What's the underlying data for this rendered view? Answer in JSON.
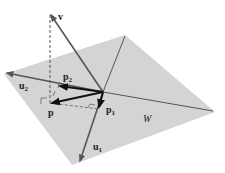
{
  "diagram": {
    "colors": {
      "plane_fill": "#d4d4d4",
      "vector_stroke": "#555555",
      "bold_vector_stroke": "#1a1a1a",
      "axis_line": "#555555",
      "label": "#222222",
      "background": "#ffffff"
    },
    "plane": {
      "label": "W",
      "vertices": [
        [
          125,
          35
        ],
        [
          215,
          112
        ],
        [
          72,
          165
        ],
        [
          4,
          74
        ]
      ]
    },
    "origin": [
      103,
      92
    ],
    "vectors": {
      "v": {
        "label": "v",
        "tip": [
          50,
          13
        ]
      },
      "u1": {
        "label": "u",
        "subscript": "1",
        "tip": [
          80,
          162
        ]
      },
      "u2": {
        "label": "u",
        "subscript": "2",
        "tip": [
          6,
          72
        ]
      },
      "p": {
        "label": "p",
        "tip": [
          50,
          103
        ]
      },
      "p1": {
        "label": "p",
        "subscript": "1",
        "tip": [
          99,
          109
        ]
      },
      "p2": {
        "label": "p",
        "subscript": "2",
        "tip": [
          58,
          87
        ]
      }
    },
    "labels": {
      "v": "v",
      "u1_base": "u",
      "u1_sub": "1",
      "u2_base": "u",
      "u2_sub": "2",
      "p": "p",
      "p1_base": "p",
      "p1_sub": "1",
      "p2_base": "p",
      "p2_sub": "2",
      "W": "W"
    }
  }
}
